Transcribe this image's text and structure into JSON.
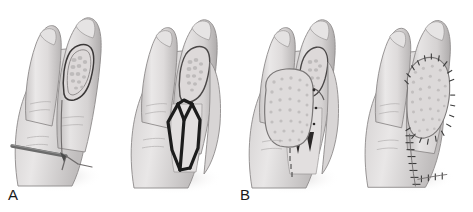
{
  "figure": {
    "style": "grayscale-medical-line-drawing",
    "background_color": "#ffffff",
    "width": 473,
    "height": 212,
    "panel_count": 4
  },
  "palette": {
    "background": "#ffffff",
    "skin_light": "#eceaea",
    "skin_mid": "#d9d6d6",
    "skin_shadow": "#bdbaba",
    "skin_deep_shadow": "#a5a2a2",
    "outline": "#8d8a8a",
    "outline_dark": "#6e6b6b",
    "flap_marking": "#1c1c1c",
    "wire_metal": "#6b6b6b",
    "wire_metal_dark": "#4a4a4a",
    "graft_texture": "#cfcccc",
    "suture_ink": "#3a3a3a",
    "label_text": "#1a1a1a",
    "drop_shadow": "#d7d4d4"
  },
  "panels": [
    {
      "id": "panel-a",
      "label": "A",
      "caption": "Defect of the digit with exposed bone, stabilized by a transverse Kirschner wire",
      "features": [
        "index-finger-dorsal-defect",
        "exposed-bone-wound-bed",
        "transverse-k-wire",
        "adjacent-finger",
        "fingernail-plate"
      ]
    },
    {
      "id": "panel-b",
      "label": "B",
      "caption": "Flap design outlined on the adjacent digit donor site",
      "features": [
        "flap-design-marking",
        "bilobed-incision-outline",
        "donor-site-digit",
        "open-wound-bed"
      ]
    },
    {
      "id": "panel-c",
      "label": "C",
      "caption": "Flap elevated and transposed to cover the defect",
      "features": [
        "elevated-flap",
        "flap-pedicle",
        "donor-defect",
        "partial-suture-line"
      ]
    },
    {
      "id": "panel-d",
      "label": "D",
      "caption": "Completed inset with suture closure of flap and donor site",
      "features": [
        "inset-flap",
        "circumferential-suture-line",
        "donor-site-closure-suture-line"
      ]
    }
  ],
  "labels": {
    "a": "A",
    "b": "B",
    "c": "C",
    "d": "D"
  }
}
